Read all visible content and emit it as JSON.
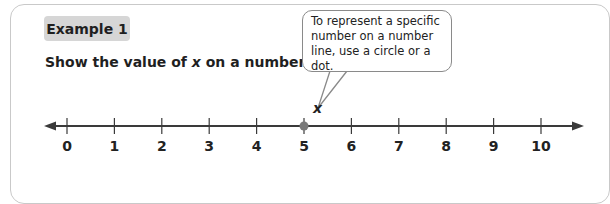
{
  "example": {
    "badge": "Example 1",
    "prompt_before": "Show the value of ",
    "prompt_var": "x",
    "prompt_after": " on a number line."
  },
  "callout": {
    "text": "To represent a specific number on a number line, use a circle or a dot."
  },
  "number_line": {
    "variable_label": "x",
    "ticks": [
      "0",
      "1",
      "2",
      "3",
      "4",
      "5",
      "6",
      "7",
      "8",
      "9",
      "10"
    ],
    "marked_value": "5",
    "dot_color": "#7a7a7a",
    "line_color": "#3a3a3a"
  }
}
